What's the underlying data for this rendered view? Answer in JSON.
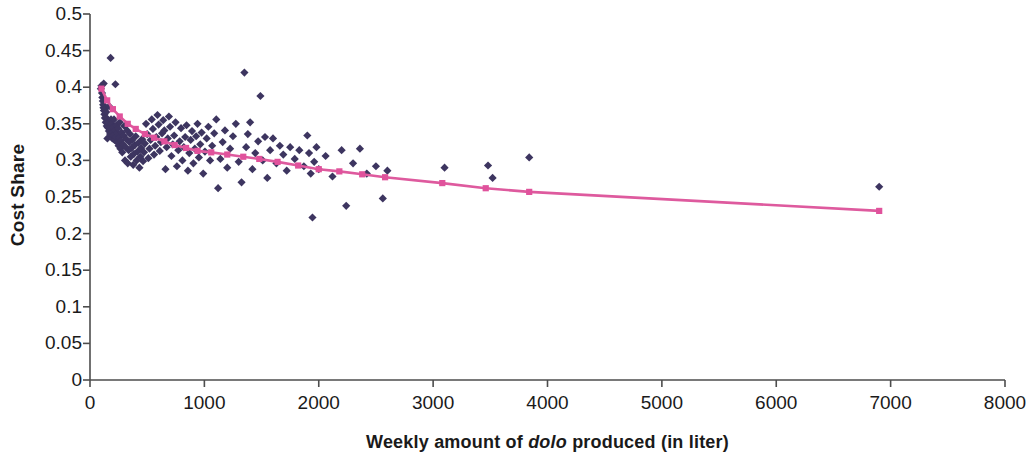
{
  "chart_data": {
    "type": "scatter",
    "title": "",
    "xlabel_parts": {
      "before": "Weekly amount of ",
      "italic": "dolo",
      "after": " produced (in liter)"
    },
    "xlabel": "Weekly amount of dolo produced (in liter)",
    "ylabel": "Cost Share",
    "xlim": [
      0,
      8000
    ],
    "ylim": [
      0,
      0.5
    ],
    "xticks": [
      0,
      1000,
      2000,
      3000,
      4000,
      5000,
      6000,
      7000,
      8000
    ],
    "yticks": [
      0,
      0.05,
      0.1,
      0.15,
      0.2,
      0.25,
      0.3,
      0.35,
      0.4,
      0.45,
      0.5
    ],
    "xtick_labels": [
      "0",
      "1000",
      "2000",
      "3000",
      "4000",
      "5000",
      "6000",
      "7000",
      "8000"
    ],
    "ytick_labels": [
      "0",
      "0.05",
      "0.1",
      "0.15",
      "0.2",
      "0.25",
      "0.3",
      "0.35",
      "0.4",
      "0.45",
      "0.5"
    ],
    "grid": false,
    "legend": "none",
    "series": [
      {
        "name": "Cost share observations",
        "type": "scatter",
        "marker": "diamond",
        "color": "#3d3560",
        "points": [
          [
            95,
            0.398
          ],
          [
            100,
            0.402
          ],
          [
            105,
            0.392
          ],
          [
            108,
            0.386
          ],
          [
            112,
            0.381
          ],
          [
            115,
            0.376
          ],
          [
            118,
            0.372
          ],
          [
            120,
            0.405
          ],
          [
            122,
            0.368
          ],
          [
            126,
            0.363
          ],
          [
            130,
            0.358
          ],
          [
            134,
            0.371
          ],
          [
            138,
            0.352
          ],
          [
            142,
            0.366
          ],
          [
            146,
            0.347
          ],
          [
            150,
            0.357
          ],
          [
            152,
            0.33
          ],
          [
            155,
            0.345
          ],
          [
            160,
            0.352
          ],
          [
            165,
            0.34
          ],
          [
            168,
            0.374
          ],
          [
            172,
            0.344
          ],
          [
            176,
            0.336
          ],
          [
            180,
            0.44
          ],
          [
            184,
            0.356
          ],
          [
            188,
            0.35
          ],
          [
            192,
            0.338
          ],
          [
            196,
            0.33
          ],
          [
            200,
            0.345
          ],
          [
            205,
            0.334
          ],
          [
            210,
            0.356
          ],
          [
            214,
            0.328
          ],
          [
            218,
            0.341
          ],
          [
            222,
            0.404
          ],
          [
            226,
            0.332
          ],
          [
            230,
            0.348
          ],
          [
            236,
            0.325
          ],
          [
            240,
            0.337
          ],
          [
            246,
            0.344
          ],
          [
            250,
            0.32
          ],
          [
            256,
            0.331
          ],
          [
            260,
            0.352
          ],
          [
            266,
            0.316
          ],
          [
            270,
            0.327
          ],
          [
            276,
            0.338
          ],
          [
            282,
            0.311
          ],
          [
            288,
            0.322
          ],
          [
            294,
            0.334
          ],
          [
            300,
            0.347
          ],
          [
            306,
            0.3
          ],
          [
            312,
            0.318
          ],
          [
            318,
            0.329
          ],
          [
            324,
            0.341
          ],
          [
            330,
            0.296
          ],
          [
            338,
            0.314
          ],
          [
            344,
            0.325
          ],
          [
            350,
            0.336
          ],
          [
            356,
            0.305
          ],
          [
            364,
            0.317
          ],
          [
            370,
            0.328
          ],
          [
            378,
            0.294
          ],
          [
            384,
            0.309
          ],
          [
            392,
            0.321
          ],
          [
            400,
            0.333
          ],
          [
            408,
            0.3
          ],
          [
            416,
            0.312
          ],
          [
            424,
            0.324
          ],
          [
            432,
            0.29
          ],
          [
            440,
            0.305
          ],
          [
            448,
            0.317
          ],
          [
            456,
            0.329
          ],
          [
            464,
            0.299
          ],
          [
            472,
            0.311
          ],
          [
            480,
            0.323
          ],
          [
            490,
            0.35
          ],
          [
            500,
            0.336
          ],
          [
            510,
            0.303
          ],
          [
            520,
            0.316
          ],
          [
            530,
            0.328
          ],
          [
            540,
            0.356
          ],
          [
            550,
            0.343
          ],
          [
            560,
            0.308
          ],
          [
            570,
            0.32
          ],
          [
            580,
            0.332
          ],
          [
            590,
            0.362
          ],
          [
            600,
            0.349
          ],
          [
            610,
            0.313
          ],
          [
            620,
            0.325
          ],
          [
            630,
            0.337
          ],
          [
            640,
            0.355
          ],
          [
            650,
            0.341
          ],
          [
            660,
            0.288
          ],
          [
            670,
            0.318
          ],
          [
            680,
            0.33
          ],
          [
            690,
            0.36
          ],
          [
            700,
            0.346
          ],
          [
            712,
            0.306
          ],
          [
            724,
            0.322
          ],
          [
            736,
            0.334
          ],
          [
            748,
            0.352
          ],
          [
            760,
            0.292
          ],
          [
            772,
            0.314
          ],
          [
            784,
            0.326
          ],
          [
            796,
            0.344
          ],
          [
            808,
            0.3
          ],
          [
            820,
            0.318
          ],
          [
            832,
            0.332
          ],
          [
            844,
            0.348
          ],
          [
            856,
            0.286
          ],
          [
            868,
            0.31
          ],
          [
            880,
            0.328
          ],
          [
            892,
            0.34
          ],
          [
            904,
            0.296
          ],
          [
            916,
            0.316
          ],
          [
            928,
            0.333
          ],
          [
            940,
            0.35
          ],
          [
            952,
            0.304
          ],
          [
            964,
            0.322
          ],
          [
            976,
            0.338
          ],
          [
            990,
            0.282
          ],
          [
            1005,
            0.312
          ],
          [
            1020,
            0.33
          ],
          [
            1035,
            0.346
          ],
          [
            1050,
            0.3
          ],
          [
            1068,
            0.32
          ],
          [
            1086,
            0.337
          ],
          [
            1104,
            0.356
          ],
          [
            1120,
            0.262
          ],
          [
            1140,
            0.302
          ],
          [
            1160,
            0.325
          ],
          [
            1180,
            0.341
          ],
          [
            1200,
            0.29
          ],
          [
            1225,
            0.316
          ],
          [
            1250,
            0.333
          ],
          [
            1275,
            0.35
          ],
          [
            1300,
            0.298
          ],
          [
            1325,
            0.27
          ],
          [
            1350,
            0.42
          ],
          [
            1365,
            0.318
          ],
          [
            1380,
            0.336
          ],
          [
            1400,
            0.352
          ],
          [
            1420,
            0.288
          ],
          [
            1445,
            0.31
          ],
          [
            1470,
            0.326
          ],
          [
            1490,
            0.388
          ],
          [
            1510,
            0.3
          ],
          [
            1530,
            0.332
          ],
          [
            1550,
            0.276
          ],
          [
            1575,
            0.314
          ],
          [
            1600,
            0.33
          ],
          [
            1630,
            0.296
          ],
          [
            1660,
            0.32
          ],
          [
            1690,
            0.308
          ],
          [
            1720,
            0.286
          ],
          [
            1750,
            0.318
          ],
          [
            1790,
            0.302
          ],
          [
            1830,
            0.314
          ],
          [
            1870,
            0.292
          ],
          [
            1900,
            0.334
          ],
          [
            1915,
            0.31
          ],
          [
            1930,
            0.282
          ],
          [
            1945,
            0.222
          ],
          [
            1960,
            0.298
          ],
          [
            1980,
            0.318
          ],
          [
            2000,
            0.288
          ],
          [
            2060,
            0.306
          ],
          [
            2120,
            0.278
          ],
          [
            2200,
            0.314
          ],
          [
            2240,
            0.238
          ],
          [
            2300,
            0.296
          ],
          [
            2360,
            0.316
          ],
          [
            2420,
            0.282
          ],
          [
            2500,
            0.292
          ],
          [
            2560,
            0.248
          ],
          [
            2600,
            0.286
          ],
          [
            3100,
            0.29
          ],
          [
            3480,
            0.293
          ],
          [
            3520,
            0.276
          ],
          [
            3840,
            0.304
          ],
          [
            6900,
            0.264
          ]
        ]
      },
      {
        "name": "Fitted trend (moving average)",
        "type": "line",
        "marker": "square",
        "color": "#e0529c",
        "line_color": "#de5a9e",
        "points": [
          [
            100,
            0.398
          ],
          [
            150,
            0.382
          ],
          [
            200,
            0.37
          ],
          [
            260,
            0.36
          ],
          [
            330,
            0.35
          ],
          [
            400,
            0.343
          ],
          [
            480,
            0.336
          ],
          [
            560,
            0.331
          ],
          [
            650,
            0.326
          ],
          [
            740,
            0.321
          ],
          [
            840,
            0.317
          ],
          [
            940,
            0.313
          ],
          [
            1060,
            0.311
          ],
          [
            1200,
            0.308
          ],
          [
            1340,
            0.305
          ],
          [
            1480,
            0.302
          ],
          [
            1640,
            0.298
          ],
          [
            1820,
            0.293
          ],
          [
            2000,
            0.288
          ],
          [
            2180,
            0.285
          ],
          [
            2380,
            0.281
          ],
          [
            2580,
            0.277
          ],
          [
            3080,
            0.269
          ],
          [
            3460,
            0.262
          ],
          [
            3840,
            0.257
          ],
          [
            6900,
            0.231
          ]
        ]
      }
    ]
  },
  "axis": {
    "axis_color": "#4d4d4d",
    "background": "#ffffff"
  }
}
